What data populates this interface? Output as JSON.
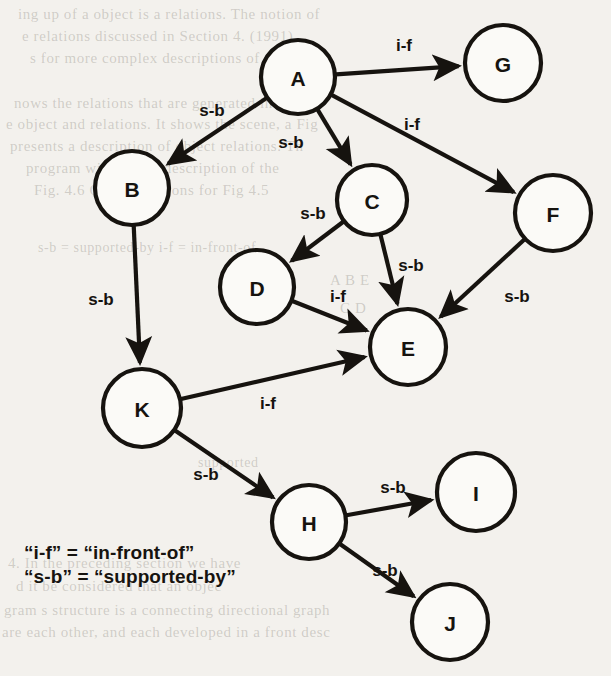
{
  "figure": {
    "type": "directed-graph"
  },
  "chart_data": {
    "type": "diagram",
    "title": "",
    "nodes": [
      {
        "id": "A",
        "label": "A",
        "x": 298,
        "y": 77,
        "r": 37
      },
      {
        "id": "G",
        "label": "G",
        "x": 503,
        "y": 63,
        "r": 38
      },
      {
        "id": "B",
        "label": "B",
        "x": 132,
        "y": 188,
        "r": 37
      },
      {
        "id": "C",
        "label": "C",
        "x": 372,
        "y": 200,
        "r": 35
      },
      {
        "id": "F",
        "label": "F",
        "x": 553,
        "y": 213,
        "r": 38
      },
      {
        "id": "D",
        "label": "D",
        "x": 257,
        "y": 287,
        "r": 37
      },
      {
        "id": "E",
        "label": "E",
        "x": 408,
        "y": 347,
        "r": 38
      },
      {
        "id": "K",
        "label": "K",
        "x": 142,
        "y": 408,
        "r": 39
      },
      {
        "id": "H",
        "label": "H",
        "x": 309,
        "y": 522,
        "r": 37
      },
      {
        "id": "I",
        "label": "I",
        "x": 476,
        "y": 492,
        "r": 39
      },
      {
        "id": "J",
        "label": "J",
        "x": 450,
        "y": 622,
        "r": 38
      }
    ],
    "edges": [
      {
        "from": "A",
        "to": "G",
        "label": "i-f",
        "lx": 404,
        "ly": 45
      },
      {
        "from": "A",
        "to": "B",
        "label": "s-b",
        "lx": 212,
        "ly": 110
      },
      {
        "from": "A",
        "to": "C",
        "label": "s-b",
        "lx": 291,
        "ly": 142
      },
      {
        "from": "A",
        "to": "F",
        "label": "i-f",
        "lx": 412,
        "ly": 124
      },
      {
        "from": "B",
        "to": "K",
        "label": "s-b",
        "lx": 101,
        "ly": 299
      },
      {
        "from": "C",
        "to": "D",
        "label": "s-b",
        "lx": 313,
        "ly": 213
      },
      {
        "from": "C",
        "to": "E",
        "label": "s-b",
        "lx": 411,
        "ly": 265
      },
      {
        "from": "D",
        "to": "E",
        "label": "i-f",
        "lx": 338,
        "ly": 296
      },
      {
        "from": "F",
        "to": "E",
        "label": "s-b",
        "lx": 517,
        "ly": 296
      },
      {
        "from": "K",
        "to": "E",
        "label": "i-f",
        "lx": 268,
        "ly": 403
      },
      {
        "from": "K",
        "to": "H",
        "label": "s-b",
        "lx": 206,
        "ly": 474
      },
      {
        "from": "H",
        "to": "I",
        "label": "s-b",
        "lx": 393,
        "ly": 487
      },
      {
        "from": "H",
        "to": "J",
        "label": "s-b",
        "lx": 385,
        "ly": 570
      }
    ]
  },
  "legend": {
    "line1": "“i-f” = “in-front-of”",
    "line2": "“s-b” = “supported-by”"
  },
  "background_text": [
    {
      "text": "ing  up of a  object is a relations. The notion of",
      "x": 18,
      "y": 6,
      "size": 15,
      "rev": false
    },
    {
      "text": "e   relations  discussed   in    Section  4.  (1991)",
      "x": 22,
      "y": 28,
      "size": 15,
      "rev": false
    },
    {
      "text": "s   for more complex descriptions of objects.",
      "x": 30,
      "y": 50,
      "size": 15,
      "rev": false
    },
    {
      "text": "nows   the   relations that   are   generated   in",
      "x": 14,
      "y": 95,
      "size": 15,
      "rev": false
    },
    {
      "text": "e object and  relations. It  shows the scene, a  Fig",
      "x": 6,
      "y": 116,
      "size": 15,
      "rev": false
    },
    {
      "text": "presents   a   description of object  relations. Th",
      "x": 10,
      "y": 138,
      "size": 15,
      "rev": false
    },
    {
      "text": "program  will  draw  a  description  of  the",
      "x": 26,
      "y": 160,
      "size": 15,
      "rev": false
    },
    {
      "text": "Fig. 4.6   Object  relations for  Fig 4.5",
      "x": 34,
      "y": 182,
      "size": 15,
      "rev": false
    },
    {
      "text": "s-b = supported-by    i-f = in-front-of",
      "x": 38,
      "y": 240,
      "size": 14,
      "rev": false
    },
    {
      "text": "A   B   E",
      "x": 330,
      "y": 272,
      "size": 15,
      "rev": false
    },
    {
      "text": "C  D",
      "x": 340,
      "y": 300,
      "size": 15,
      "rev": false
    },
    {
      "text": "supported",
      "x": 198,
      "y": 455,
      "size": 14,
      "rev": false
    },
    {
      "text": "4. In  the  preceding  section   we   have",
      "x": 8,
      "y": 555,
      "size": 15,
      "rev": false
    },
    {
      "text": "d   it  be  considered  that   an   objec",
      "x": 16,
      "y": 578,
      "size": 15,
      "rev": false
    },
    {
      "text": "gram   s   structure  is  a  connecting  directional  graph",
      "x": 4,
      "y": 602,
      "size": 15,
      "rev": false
    },
    {
      "text": "are  each other,  and  each  developed  in  a  front  desc",
      "x": 2,
      "y": 624,
      "size": 15,
      "rev": false
    }
  ]
}
